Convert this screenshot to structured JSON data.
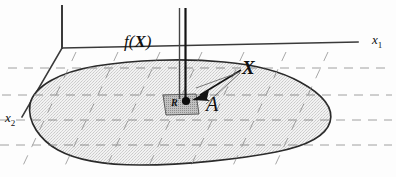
{
  "figure": {
    "labels": {
      "function_label": "f(X)",
      "function_label_arg": "X",
      "function_label_prefix": "f(",
      "function_label_suffix": ")",
      "point_label": "X",
      "area_label": "A",
      "region_label": "R",
      "axis_x1": "x",
      "axis_x1_sub": "1",
      "axis_x2": "x",
      "axis_x2_sub": "2"
    },
    "colors": {
      "ink": "#1a1a1a",
      "axis": "#3a3a3a",
      "dashed_grid": "#9a9a9a",
      "blob_fill": "#e3e3e3",
      "blob_stroke": "#2b2b2b",
      "region_fill": "#b3b3b3",
      "region_stroke": "#555555",
      "background": "#fdfdfd"
    },
    "geometry": {
      "origin": [
        62,
        48
      ],
      "x1_axis_end": [
        358,
        42
      ],
      "x2_axis_end": [
        22,
        117
      ],
      "vertical_axis_top": [
        62,
        6
      ],
      "ordinate_bar_x": [
        179,
        186
      ],
      "ordinate_bar_top": 8,
      "point_dot": [
        186,
        101
      ],
      "x_label_pos": [
        243,
        58
      ],
      "a_label_pos": [
        207,
        96
      ],
      "horizontal_grid_y": [
        68,
        95,
        120,
        145
      ],
      "canvas": [
        396,
        177
      ]
    }
  }
}
